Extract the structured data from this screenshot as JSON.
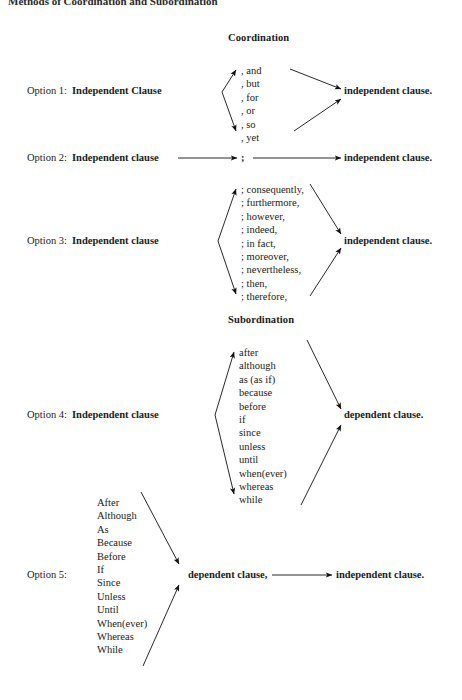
{
  "page": {
    "heading": "Methods of Coordination and Subordination",
    "width": 462,
    "height": 700,
    "ink_color": "#1b1b1b",
    "background": "#ffffff"
  },
  "sections": [
    {
      "id": "coordination",
      "title": "Coordination"
    },
    {
      "id": "subordination",
      "title": "Subordination"
    }
  ],
  "options": [
    {
      "id": "option-1",
      "label": "Option 1:",
      "left_clause": "Independent Clause",
      "right_clause": "independent clause.",
      "connectors": [
        ", and",
        ", but",
        ", for",
        ", or",
        ", so",
        ", yet"
      ]
    },
    {
      "id": "option-2",
      "label": "Option 2:",
      "left_clause": "Independent clause",
      "right_clause": "independent clause.",
      "connectors": [
        ";"
      ]
    },
    {
      "id": "option-3",
      "label": "Option 3:",
      "left_clause": "Independent clause",
      "right_clause": "independent clause.",
      "connectors": [
        "; consequently,",
        "; furthermore,",
        "; however,",
        "; indeed,",
        "; in fact,",
        "; moreover,",
        "; nevertheless,",
        "; then,",
        "; therefore,"
      ]
    },
    {
      "id": "option-4",
      "label": "Option 4:",
      "left_clause": "Independent clause",
      "right_clause": "dependent clause.",
      "connectors": [
        "after",
        "although",
        "as (as if)",
        "because",
        "before",
        "if",
        "since",
        "unless",
        "until",
        "when(ever)",
        "whereas",
        "while"
      ]
    },
    {
      "id": "option-5",
      "label": "Option 5:",
      "middle_clause": "dependent clause,",
      "right_clause": "independent clause.",
      "connectors": [
        "After",
        "Although",
        "As",
        "Because",
        "Before",
        "If",
        "Since",
        "Unless",
        "Until",
        "When(ever)",
        "Whereas",
        "While"
      ]
    }
  ]
}
